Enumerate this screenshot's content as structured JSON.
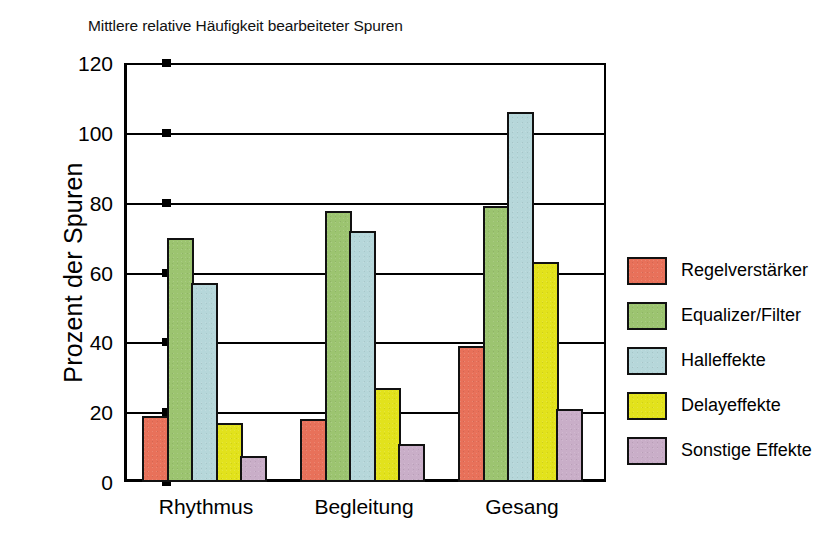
{
  "chart_data": {
    "type": "bar",
    "title": "Mittlere relative Häufigkeit bearbeiteter Spuren",
    "xlabel": "",
    "ylabel": "Prozent der Spuren",
    "categories": [
      "Rhythmus",
      "Begleitung",
      "Gesang"
    ],
    "series": [
      {
        "name": "Regelverstärker",
        "color": "#E8715A",
        "values": [
          19,
          18,
          39
        ]
      },
      {
        "name": "Equalizer/Filter",
        "color": "#9CC islands",
        "values": [
          70,
          77.5,
          79
        ]
      },
      {
        "name": "Halleffekte",
        "color": "#B6D7DA",
        "values": [
          57,
          72,
          106
        ]
      },
      {
        "name": "Delayeffekte",
        "color": "#E2E21C",
        "values": [
          17,
          27,
          63
        ]
      },
      {
        "name": "Sonstige Effekte",
        "color": "#C9AEC8",
        "values": [
          7.5,
          11,
          21
        ]
      }
    ],
    "ylim": [
      0,
      120
    ],
    "yticks": [
      0,
      20,
      40,
      60,
      80,
      100,
      120
    ],
    "ytick_labels": [
      "0",
      "20",
      "40",
      "60",
      "80",
      "100",
      "120"
    ],
    "grid": true,
    "legend_position": "right"
  },
  "colors": {
    "series": [
      "#E8715A",
      "#9CC470",
      "#B6D7DA",
      "#E2E21C",
      "#C9AEC8"
    ],
    "axis": "#000000",
    "background": "#FFFFFF"
  }
}
